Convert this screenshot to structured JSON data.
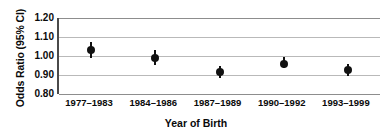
{
  "chart_data": {
    "type": "scatter",
    "title": "",
    "xlabel": "Year of Birth",
    "ylabel": "Odds Ratio (95% CI)",
    "categories": [
      "1977–1983",
      "1984–1986",
      "1987–1989",
      "1990–1992",
      "1993–1999"
    ],
    "values": [
      1.03,
      0.99,
      0.915,
      0.96,
      0.925
    ],
    "error_low": [
      0.99,
      0.955,
      0.885,
      0.935,
      0.895
    ],
    "error_high": [
      1.075,
      1.03,
      0.95,
      0.995,
      0.96
    ],
    "ylim": [
      0.8,
      1.2
    ],
    "yticks": [
      "1.20",
      "1.10",
      "1.00",
      "0.90",
      "0.80"
    ],
    "ytick_values": [
      1.2,
      1.1,
      1.0,
      0.9,
      0.8
    ],
    "grid": true,
    "legend": "none",
    "marker": "filled-circle",
    "series_name": "Odds Ratio"
  },
  "colors": {
    "marker": "#111111",
    "gridline": "#b9b9b9",
    "axis": "#4a4a4a",
    "text": "#0a0a0a",
    "background": "#ffffff"
  }
}
